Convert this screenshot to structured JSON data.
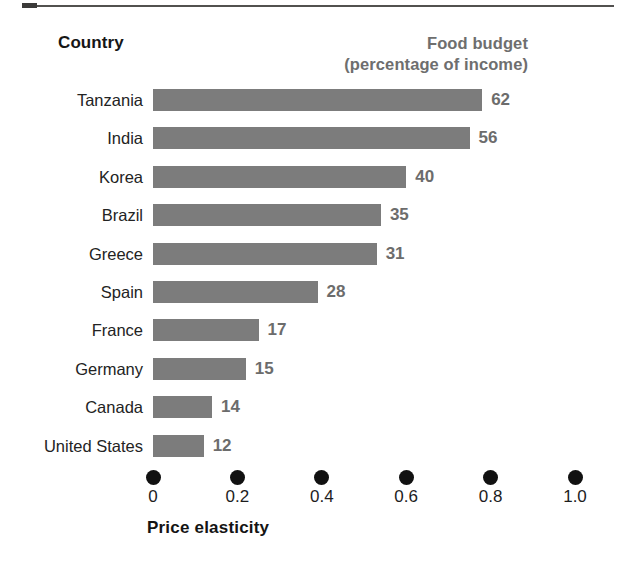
{
  "headers": {
    "country": "Country",
    "food_budget_line1": "Food budget",
    "food_budget_line2": "(percentage of income)"
  },
  "axis": {
    "title": "Price elasticity",
    "ticks": [
      "0",
      "0.2",
      "0.4",
      "0.6",
      "0.8",
      "1.0"
    ]
  },
  "rows": [
    {
      "country": "Tanzania",
      "food_budget": "62",
      "elasticity": 0.78
    },
    {
      "country": "India",
      "food_budget": "56",
      "elasticity": 0.75
    },
    {
      "country": "Korea",
      "food_budget": "40",
      "elasticity": 0.6
    },
    {
      "country": "Brazil",
      "food_budget": "35",
      "elasticity": 0.54
    },
    {
      "country": "Greece",
      "food_budget": "31",
      "elasticity": 0.53
    },
    {
      "country": "Spain",
      "food_budget": "28",
      "elasticity": 0.39
    },
    {
      "country": "France",
      "food_budget": "17",
      "elasticity": 0.25
    },
    {
      "country": "Germany",
      "food_budget": "15",
      "elasticity": 0.22
    },
    {
      "country": "Canada",
      "food_budget": "14",
      "elasticity": 0.14
    },
    {
      "country": "United States",
      "food_budget": "12",
      "elasticity": 0.12
    }
  ],
  "colors": {
    "bar": "#7c7c7c",
    "value_label": "#6c6c6c",
    "header_secondary": "#6e6e6e",
    "axis_dot": "#111111",
    "text": "#1a1a1a"
  },
  "chart_data": {
    "type": "bar",
    "orientation": "horizontal",
    "title": "",
    "xlabel": "Price elasticity",
    "ylabel": "Country",
    "xlim": [
      0,
      1.0
    ],
    "xticks": [
      0,
      0.2,
      0.4,
      0.6,
      0.8,
      1.0
    ],
    "grid": false,
    "legend": "none",
    "categories": [
      "Tanzania",
      "India",
      "Korea",
      "Brazil",
      "Greece",
      "Spain",
      "France",
      "Germany",
      "Canada",
      "United States"
    ],
    "series": [
      {
        "name": "Price elasticity",
        "values": [
          0.78,
          0.75,
          0.6,
          0.54,
          0.53,
          0.39,
          0.25,
          0.22,
          0.14,
          0.12
        ]
      },
      {
        "name": "Food budget (percentage of income)",
        "values": [
          62,
          56,
          40,
          35,
          31,
          28,
          17,
          15,
          14,
          12
        ],
        "rendered_as": "data labels at bar ends"
      }
    ],
    "annotations": [
      "Country",
      "Food budget",
      "(percentage of income)"
    ]
  }
}
